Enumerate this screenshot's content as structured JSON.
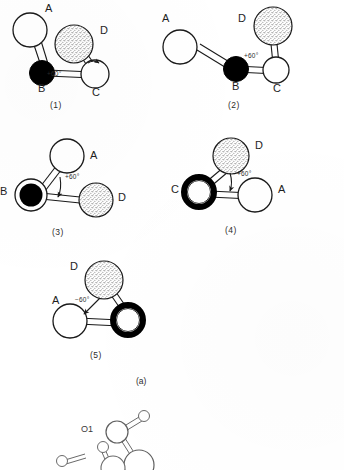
{
  "figure": {
    "panel_label": "(a)",
    "diagrams": [
      {
        "caption": "(1)",
        "angle_label": "+60°",
        "atoms": [
          {
            "name": "A",
            "style": "open"
          },
          {
            "name": "B",
            "style": "filled"
          },
          {
            "name": "C",
            "style": "open"
          },
          {
            "name": "D",
            "style": "stippled"
          }
        ]
      },
      {
        "caption": "(2)",
        "angle_label": "+60°",
        "atoms": [
          {
            "name": "A",
            "style": "open"
          },
          {
            "name": "B",
            "style": "filled"
          },
          {
            "name": "C",
            "style": "open"
          },
          {
            "name": "D",
            "style": "stippled"
          }
        ]
      },
      {
        "caption": "(3)",
        "angle_label": "+60°",
        "atoms": [
          {
            "name": "A",
            "style": "open"
          },
          {
            "name": "B",
            "style": "filled"
          },
          {
            "name": "D",
            "style": "stippled"
          }
        ]
      },
      {
        "caption": "(4)",
        "angle_label": "+60°",
        "atoms": [
          {
            "name": "A",
            "style": "open"
          },
          {
            "name": "C",
            "style": "ring"
          },
          {
            "name": "D",
            "style": "stippled"
          }
        ]
      },
      {
        "caption": "(5)",
        "angle_label": "−60°",
        "atoms": [
          {
            "name": "A",
            "style": "open"
          },
          {
            "name": "D",
            "style": "stippled"
          },
          {
            "name": "C",
            "style": "ring"
          }
        ]
      }
    ],
    "structure": {
      "label_o1": "O1"
    }
  },
  "colors": {
    "ink": "#1a1a1a",
    "paper": "#ffffff",
    "filled_atom": "#000000",
    "stipple": "#6e6e6e"
  }
}
